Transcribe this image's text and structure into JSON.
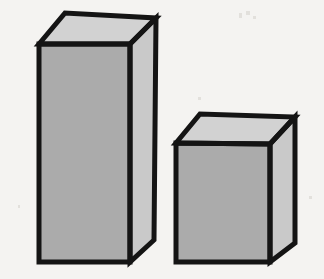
{
  "figure": {
    "width": 324,
    "height": 279,
    "background_color": "#f4f3f1",
    "outline_color": "#141414",
    "outline_width": 5,
    "noise_speck_color": "#e2e0dc"
  },
  "palette": {
    "front_face": "#ababab",
    "side_face": "#c9c9c9",
    "top_face": "#d2d2d2",
    "edge": "#141414"
  },
  "shapes": [
    {
      "name": "tall-box",
      "label": "Tall box (left)",
      "front_face": {
        "name": "front-face",
        "fill": "#ababab",
        "points": "39,44 130,44 130,262 39,262"
      },
      "top_face": {
        "name": "top-face",
        "fill": "#d2d2d2",
        "points": "39,44 65,13 156,18 130,44"
      },
      "side_face": {
        "name": "side-face",
        "fill": "#c9c9c9",
        "points": "130,44 156,18 154,240 130,262"
      },
      "geometry": {
        "front_top_left": [
          39,
          44
        ],
        "front_top_right": [
          130,
          44
        ],
        "front_bottom_right": [
          130,
          262
        ],
        "front_bottom_left": [
          39,
          262
        ],
        "back_top_left": [
          65,
          13
        ],
        "back_top_right": [
          156,
          18
        ],
        "back_bottom_right": [
          154,
          240
        ],
        "front_width": 91,
        "front_height": 218
      }
    },
    {
      "name": "short-box",
      "label": "Short box (right)",
      "front_face": {
        "name": "front-face",
        "fill": "#ababab",
        "points": "176,143 270,144 270,262 176,262"
      },
      "top_face": {
        "name": "top-face",
        "fill": "#d2d2d2",
        "points": "176,143 200,114 295,117 270,144"
      },
      "side_face": {
        "name": "side-face",
        "fill": "#c9c9c9",
        "points": "270,144 295,117 295,243 270,262"
      },
      "geometry": {
        "front_top_left": [
          176,
          143
        ],
        "front_top_right": [
          270,
          144
        ],
        "front_bottom_right": [
          270,
          262
        ],
        "front_bottom_left": [
          176,
          262
        ],
        "back_top_left": [
          200,
          114
        ],
        "back_top_right": [
          295,
          117
        ],
        "back_bottom_right": [
          295,
          243
        ],
        "front_width": 94,
        "front_height": 119
      }
    }
  ],
  "specks": [
    {
      "x": 239,
      "y": 13,
      "w": 3,
      "h": 5
    },
    {
      "x": 246,
      "y": 11,
      "w": 4,
      "h": 4
    },
    {
      "x": 253,
      "y": 16,
      "w": 3,
      "h": 3
    },
    {
      "x": 198,
      "y": 97,
      "w": 3,
      "h": 3
    },
    {
      "x": 18,
      "y": 205,
      "w": 2,
      "h": 3
    },
    {
      "x": 309,
      "y": 196,
      "w": 3,
      "h": 3
    }
  ]
}
